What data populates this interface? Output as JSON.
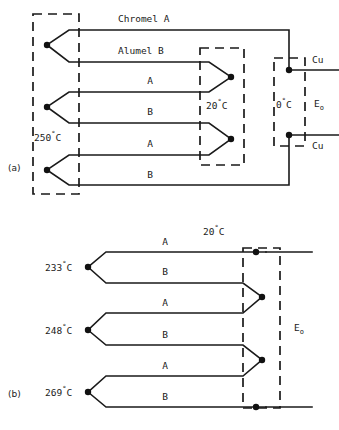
{
  "figure": {
    "panels": [
      {
        "id": "a",
        "label": "(a)"
      },
      {
        "id": "b",
        "label": "(b)"
      }
    ]
  },
  "panel_a": {
    "panel_label": "(a)",
    "hot_zone": {
      "name": "measuring-junction-zone",
      "temperature": "250",
      "degree": "°",
      "unit": "C",
      "temperature_label": "250°C",
      "junction_count": 3
    },
    "reference_zone": {
      "name": "intermediate-reference-zone",
      "temperature": "20",
      "degree": "°",
      "unit": "C",
      "temperature_label": "20°C",
      "junction_count": 2
    },
    "ice_zone": {
      "name": "ice-point-reference-zone",
      "temperature": "0",
      "degree": "°",
      "unit": "C",
      "temperature_label": "0°C",
      "junction_count": 2
    },
    "wires": [
      {
        "index": 1,
        "label": "Chromel A",
        "material": "Chromel",
        "leg": "A"
      },
      {
        "index": 2,
        "label": "Alumel B",
        "material": "Alumel",
        "leg": "B"
      },
      {
        "index": 3,
        "label": "A",
        "material": "Chromel",
        "leg": "A"
      },
      {
        "index": 4,
        "label": "B",
        "material": "Alumel",
        "leg": "B"
      },
      {
        "index": 5,
        "label": "A",
        "material": "Chromel",
        "leg": "A"
      },
      {
        "index": 6,
        "label": "B",
        "material": "Alumel",
        "leg": "B"
      }
    ],
    "copper_leads": [
      {
        "index": 1,
        "label": "Cu"
      },
      {
        "index": 2,
        "label": "Cu"
      }
    ],
    "output": {
      "symbol": "E",
      "subscript": "o",
      "label": "E_o"
    }
  },
  "panel_b": {
    "panel_label": "(b)",
    "reference_zone": {
      "name": "reference-junction-zone",
      "temperature": "20",
      "degree": "°",
      "unit": "C",
      "temperature_label": "20°C",
      "junction_count": 2
    },
    "junctions": [
      {
        "index": 1,
        "temperature": "233",
        "degree": "°",
        "unit": "C",
        "label": "233°C"
      },
      {
        "index": 2,
        "temperature": "248",
        "degree": "°",
        "unit": "C",
        "label": "248°C"
      },
      {
        "index": 3,
        "temperature": "269",
        "degree": "°",
        "unit": "C",
        "label": "269°C"
      }
    ],
    "wires": [
      {
        "index": 1,
        "label": "A",
        "leg": "A"
      },
      {
        "index": 2,
        "label": "B",
        "leg": "B"
      },
      {
        "index": 3,
        "label": "A",
        "leg": "A"
      },
      {
        "index": 4,
        "label": "B",
        "leg": "B"
      },
      {
        "index": 5,
        "label": "A",
        "leg": "A"
      },
      {
        "index": 6,
        "label": "B",
        "leg": "B"
      }
    ],
    "output": {
      "symbol": "E",
      "subscript": "o",
      "label": "E_o"
    }
  },
  "colors": {
    "ink": "#1a1a1a",
    "background": "#ffffff",
    "node": "#111111"
  }
}
